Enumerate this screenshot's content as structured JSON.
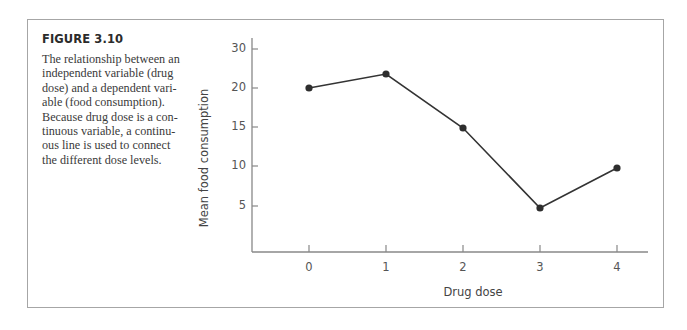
{
  "figure": {
    "title": "FIGURE 3.10",
    "caption_lines": [
      "The relationship between an",
      "independent variable (drug",
      "dose) and a dependent vari-",
      "able (food consumption).",
      "Because drug dose is a con-",
      "tinuous variable, a continu-",
      "ous line is used to connect",
      "the different dose levels."
    ]
  },
  "chart_data": {
    "type": "line",
    "title": "",
    "xlabel": "Drug dose",
    "ylabel": "Mean food consumption",
    "x": [
      0,
      1,
      2,
      3,
      4
    ],
    "series": [
      {
        "name": "Mean food consumption",
        "values": [
          20,
          23.5,
          15,
          5,
          10
        ]
      }
    ],
    "x_tick_labels": [
      "0",
      "1",
      "2",
      "3",
      "4"
    ],
    "y_tick_labels": [
      "30",
      "20",
      "15",
      "10",
      "5"
    ],
    "grid": false,
    "legend": "none",
    "markers": "filled circles",
    "colors": {
      "line": "#333333",
      "axis": "#888888",
      "frame": "#a6a6a6"
    }
  },
  "layout": {
    "x_ticks_px": [
      309,
      386,
      463,
      540,
      617
    ],
    "y_ticks_px": [
      49,
      88,
      127,
      166,
      206
    ],
    "points_px": [
      [
        309,
        88
      ],
      [
        386,
        74
      ],
      [
        463,
        128
      ],
      [
        540,
        208
      ],
      [
        617,
        168
      ]
    ]
  }
}
